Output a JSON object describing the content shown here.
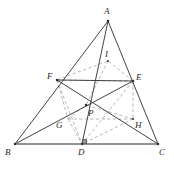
{
  "figure": {
    "stroke_color_solid": "#3a3a3a",
    "stroke_color_dashed": "#9a9a9a",
    "baseline_color": "#6f6f6f",
    "background_color": "#ffffff",
    "width": 174,
    "height": 170
  },
  "points": {
    "A": {
      "label": "A",
      "x": 108,
      "y": 21,
      "label_x": 104,
      "label_y": 7
    },
    "B": {
      "label": "B",
      "x": 15,
      "y": 144,
      "label_x": 5,
      "label_y": 148
    },
    "C": {
      "label": "C",
      "x": 158,
      "y": 144,
      "label_x": 159,
      "label_y": 148
    },
    "D": {
      "label": "D",
      "x": 82,
      "y": 144,
      "label_x": 78,
      "label_y": 148
    },
    "E": {
      "label": "E",
      "x": 133,
      "y": 81,
      "label_x": 136,
      "label_y": 74
    },
    "F": {
      "label": "F",
      "x": 57,
      "y": 80,
      "label_x": 48,
      "label_y": 73
    },
    "G": {
      "label": "G",
      "x": 68,
      "y": 119,
      "label_x": 56,
      "label_y": 122
    },
    "H": {
      "label": "H",
      "x": 133,
      "y": 119,
      "label_x": 134,
      "label_y": 121
    },
    "I": {
      "label": "I",
      "x": 108,
      "y": 61,
      "label_x": 105,
      "label_y": 51
    },
    "P": {
      "label": "P",
      "x": 86,
      "y": 105,
      "label_x": 88,
      "label_y": 110
    }
  },
  "solid_segments": [
    {
      "name": "side-AB",
      "from": "A",
      "to": "B"
    },
    {
      "name": "side-AC",
      "from": "A",
      "to": "C"
    },
    {
      "name": "side-BC",
      "from": "B",
      "to": "C"
    },
    {
      "name": "cevian-AD",
      "from": "A",
      "to": "D"
    },
    {
      "name": "cevian-BE",
      "from": "B",
      "to": "E"
    },
    {
      "name": "cevian-CF",
      "from": "C",
      "to": "F"
    },
    {
      "name": "chord-FE",
      "from": "F",
      "to": "E"
    },
    {
      "name": "segment-PD",
      "from": "P",
      "to": "D"
    }
  ],
  "dashed_segments": [
    {
      "name": "dashed-FE-upper",
      "from": "F",
      "to": "E"
    },
    {
      "name": "dashed-FI",
      "from": "F",
      "to": "I"
    },
    {
      "name": "dashed-EI",
      "from": "E",
      "to": "I"
    },
    {
      "name": "dashed-FG",
      "from": "F",
      "to": "G"
    },
    {
      "name": "dashed-EH",
      "from": "E",
      "to": "H"
    },
    {
      "name": "dashed-GH",
      "from": "G",
      "to": "H"
    },
    {
      "name": "dashed-GD",
      "from": "G",
      "to": "D"
    },
    {
      "name": "dashed-HD",
      "from": "H",
      "to": "D"
    },
    {
      "name": "dashed-FD",
      "from": "F",
      "to": "D"
    },
    {
      "name": "dashed-ED",
      "from": "E",
      "to": "D"
    },
    {
      "name": "dashed-IP",
      "from": "I",
      "to": "P"
    },
    {
      "name": "dashed-GP",
      "from": "G",
      "to": "P"
    },
    {
      "name": "dashed-HP",
      "from": "H",
      "to": "P"
    }
  ],
  "markers": {
    "right_angle_at_D": {
      "name": "right-angle-marker",
      "x": 82,
      "y": 144,
      "size": 4
    },
    "dots": [
      "A",
      "B",
      "C",
      "D",
      "E",
      "F",
      "P",
      "H",
      "I"
    ]
  }
}
